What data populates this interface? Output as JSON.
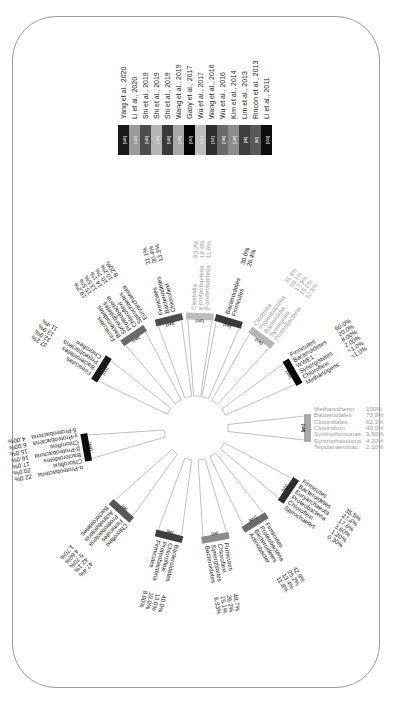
{
  "figure": {
    "rotation_deg": 90,
    "center": {
      "x": 196,
      "y": 428
    },
    "legend_title": "",
    "legend": [
      {
        "ref": "[141]",
        "label": "Yang et al., 2020",
        "color": "#1a1a1a"
      },
      {
        "ref": "[142]",
        "label": "Li et al., 2020",
        "color": "#9a9a9a"
      },
      {
        "ref": "[143]",
        "label": "Shi et al., 2019",
        "color": "#4d4d4d"
      },
      {
        "ref": "[144]",
        "label": "Shi et al., 2019",
        "color": "#b5b5b5"
      },
      {
        "ref": "[145]",
        "label": "Shi et al., 2019",
        "color": "#3a3a3a"
      },
      {
        "ref": "[146]",
        "label": "Wang et al., 2019",
        "color": "#a8a8a8"
      },
      {
        "ref": "[102]",
        "label": "Gaby et al., 2017",
        "color": "#050505"
      },
      {
        "ref": "[147]",
        "label": "Wu et al., 2017",
        "color": "#bdbdbd"
      },
      {
        "ref": "[111]",
        "label": "Wang et al., 2016",
        "color": "#2e2e2e"
      },
      {
        "ref": "[148]",
        "label": "Wu et al., 2016",
        "color": "#6b6b6b"
      },
      {
        "ref": "[149]",
        "label": "Kim et al., 2014",
        "color": "#8c8c8c"
      },
      {
        "ref": "[96]",
        "label": "Lim et al., 2013",
        "color": "#3f3f3f"
      },
      {
        "ref": "[82]",
        "label": "Rincón et al., 2013",
        "color": "#585858"
      },
      {
        "ref": "[153]",
        "label": "Li et al., 2011",
        "color": "#0d0d0d"
      }
    ],
    "wedges": [
      {
        "ref": "[141]",
        "angle": 212,
        "color": "#1a1a1a",
        "taxa": [
          "Firmicutes",
          "Bacteroidetes",
          "Proteobacteria",
          "Chloroflexi"
        ],
        "values": [
          "37.2%",
          "32.9%",
          "13.9%",
          "11.4%"
        ]
      },
      {
        "ref": "[142]",
        "angle": 236,
        "color": "#6b6b6b",
        "taxa": [
          "Firmicutes",
          "Bacteroidetes",
          "Synergistetes",
          "Proteobacteria",
          "Chloroflexi",
          "Spirochaetes",
          "Euryarchaeota"
        ],
        "values": [
          "19.2%",
          "15.5%",
          "13.5%",
          "14.1%",
          "10.7%",
          "10.2%",
          "8.20%"
        ]
      },
      {
        "ref": "[143]",
        "angle": 256,
        "color": "#4d4d4d",
        "taxa": [
          "Firmicutes",
          "Bacteroidetes",
          "Chloroflexi"
        ],
        "values": [
          "31.1%",
          "30.4%",
          "13.3%"
        ]
      },
      {
        "ref": "[147]",
        "angle": 272,
        "color": "#bdbdbd",
        "taxa": [
          "Clostridia",
          "γ-proteobacteria",
          "β-proteobacteria"
        ],
        "values": [
          "63.2%",
          "19.4%",
          "11.6%"
        ]
      },
      {
        "ref": "[145]",
        "angle": 287,
        "color": "#3a3a3a",
        "taxa": [
          "Bacteroidetes",
          "Firmicutes"
        ],
        "values": [
          "30.0%",
          "26.4%"
        ]
      },
      {
        "ref": "[146]",
        "angle": 306,
        "color": "#b5b5b5",
        "taxa": [
          "Clostridia",
          "Proteobacteria",
          "Bacteroidia",
          "Synergistia",
          "Proteobacteria"
        ],
        "values": [
          "31.4%",
          "18.1%",
          "17.5%",
          "15.0%",
          "10.8%"
        ]
      },
      {
        "ref": "[102]",
        "angle": 330,
        "color": "#050505",
        "taxa": [
          "Firmicutes",
          "Bacteroidetes",
          "WWE1",
          "Synergistetes",
          "Chloroflexi",
          "Methanogens"
        ],
        "values": [
          "60.0%",
          "20.0%",
          "8.00%",
          "2.00%",
          "<1.0%",
          "<1.0%"
        ]
      },
      {
        "ref": "[144]",
        "angle": 0,
        "color": "#a8a8a8",
        "taxa": [
          "Methanotherm.",
          "Bacteroidales",
          "Clostridiales",
          "Clostridium",
          "Syntrophomonas",
          "Syntrophaceticus",
          "Tepidanaerobac."
        ],
        "values": [
          "100%",
          "73.9%",
          "62.1%",
          "40.0%",
          "9.50%",
          "4.20%",
          "2.10%"
        ]
      },
      {
        "ref": "[111]",
        "angle": 34,
        "color": "#2e2e2e",
        "taxa": [
          "Firmicutes",
          "Bacteroidetes",
          "Euryarchaeota",
          "Proteobacteria",
          "Chloroflexi",
          "Spirochaetes"
        ],
        "values": [
          "35.5%",
          "27.4%",
          "17.6%",
          "3.60%",
          "1.20%",
          "0.30%"
        ]
      },
      {
        "ref": "[148]",
        "angle": 58,
        "color": "#6b6b6b",
        "taxa": [
          "Firmicutes",
          "Proteobacteria",
          "Bacteroidetes",
          "Actinobacter"
        ],
        "values": [
          "42.9%",
          "25.2%",
          "13.4%",
          "11.8%"
        ]
      },
      {
        "ref": "[82]",
        "angle": 80,
        "color": "#8c8c8c",
        "taxa": [
          "Firmicutes",
          "Chloroflexi",
          "Synergistetes",
          "Bacteroidetes"
        ],
        "values": [
          "48.7%",
          "26.2%",
          "15.1%",
          "6.33%"
        ]
      },
      {
        "ref": "[96]",
        "angle": 104,
        "color": "#3f3f3f",
        "taxa": [
          "Bacteroidetes",
          "Chloroflexi",
          "Proteobacteria",
          "Firmicutes"
        ],
        "values": [
          "40.0%",
          "13.0%",
          "10.0%",
          "8.00%"
        ]
      },
      {
        "ref": "[82]",
        "angle": 132,
        "color": "#585858",
        "taxa": [
          "Chloroflexi",
          "Firmicutes",
          "Proteobacteria",
          "Actinobacteria",
          "Bacteroidetes"
        ],
        "values": [
          "47.4%",
          "42.1%",
          "5.70%",
          "4.60%",
          "1.70%"
        ]
      },
      {
        "ref": "[153]",
        "angle": 170,
        "color": "#0d0d0d",
        "taxa": [
          "α-Proteobacteria",
          "Chloroflexi",
          "Bacteroidetes",
          "β-Proteobacteria",
          "Chloroflexi",
          "γ-Proteobacteria",
          "δ-Proteobacteria"
        ],
        "values": [
          "22.0%",
          "20.0%",
          "17.0%",
          "16.0%",
          "15.0%",
          "6.00%",
          "4.00%"
        ]
      }
    ]
  }
}
